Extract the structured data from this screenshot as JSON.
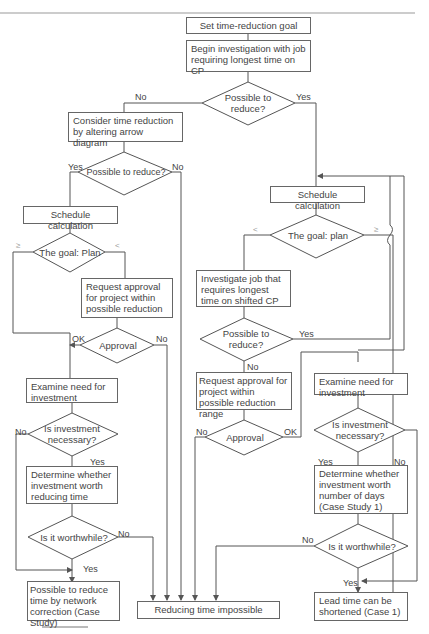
{
  "diagram": {
    "type": "flowchart",
    "nodes": {
      "set_goal": "Set time-reduction goal",
      "begin_investigation": "Begin investigation with job requiring longest time on CP",
      "d_possible_1": "Possible to reduce?",
      "consider_altering": "Consider time reduction by altering arrow diagram",
      "d_possible_left": "Possible to reduce?",
      "schedule_left": "Schedule calculation",
      "d_goal_left": "The goal: Plan",
      "request_left": "Request approval for project within possible reduction",
      "d_approval_left": "Approval",
      "examine_left": "Examine need for investment",
      "d_invest_left": "Is investment necessary?",
      "determine_left": "Determine whether investment worth reducing time",
      "d_worth_left": "Is it worthwhile?",
      "result_left": "Possible to reduce time by network correction (Case Study)",
      "impossible": "Reducing time impossible",
      "schedule_right": "Schedule calculation",
      "d_goal_right": "The goal: plan",
      "investigate_shifted": "Investigate job that requires longest time on shifted CP",
      "d_possible_right": "Possible to reduce?",
      "request_right": "Request approval for project within possible reduction range",
      "d_approval_right": "Approval",
      "examine_right": "Examine need for investment",
      "d_invest_right": "Is investment necessary?",
      "determine_right": "Determine whether investment worth number of days (Case Study 1)",
      "d_worth_right": "Is it worthwhile?",
      "result_right": "Lead time can be shortened (Case 1)"
    },
    "edge_labels": {
      "no": "No",
      "yes": "Yes",
      "ok": "OK",
      "ge": "≥",
      "lt": "<"
    },
    "line_color": "#555555"
  }
}
